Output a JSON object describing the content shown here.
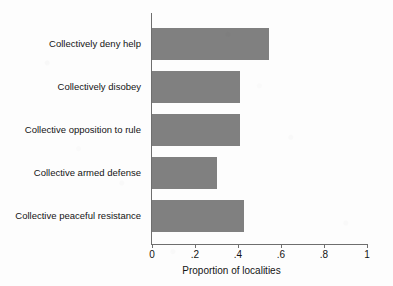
{
  "chart_data": {
    "type": "bar",
    "orientation": "horizontal",
    "title": "",
    "subtitle": "",
    "xlabel": "Proportion of localities",
    "ylabel": "",
    "categories": [
      "Collectively deny help",
      "Collectively disobey",
      "Collective opposition to rule",
      "Collective armed defense",
      "Collective peaceful resistance"
    ],
    "values": [
      0.545,
      0.41,
      0.41,
      0.3,
      0.43
    ],
    "xlim": [
      0,
      1
    ],
    "xticks": [
      0,
      0.2,
      0.4,
      0.6,
      0.8,
      1
    ],
    "xtick_labels": [
      "0",
      ".2",
      ".4",
      ".6",
      ".8",
      "1"
    ],
    "grid": false,
    "legend": null,
    "bar_color": "#808080",
    "axis_color": "#6e6e6e",
    "background_color": "#fdfdfd",
    "annotations": []
  },
  "bars": [
    {
      "label": "Collectively deny help",
      "value": 0.545
    },
    {
      "label": "Collectively disobey",
      "value": 0.41
    },
    {
      "label": "Collective opposition to rule",
      "value": 0.41
    },
    {
      "label": "Collective armed defense",
      "value": 0.3
    },
    {
      "label": "Collective peaceful resistance",
      "value": 0.43
    }
  ],
  "axis": {
    "x_title": "Proportion of localities",
    "ticks": [
      {
        "value": 0,
        "label": "0"
      },
      {
        "value": 0.2,
        "label": ".2"
      },
      {
        "value": 0.4,
        "label": ".4"
      },
      {
        "value": 0.6,
        "label": ".6"
      },
      {
        "value": 0.8,
        "label": ".8"
      },
      {
        "value": 1,
        "label": "1"
      }
    ]
  }
}
